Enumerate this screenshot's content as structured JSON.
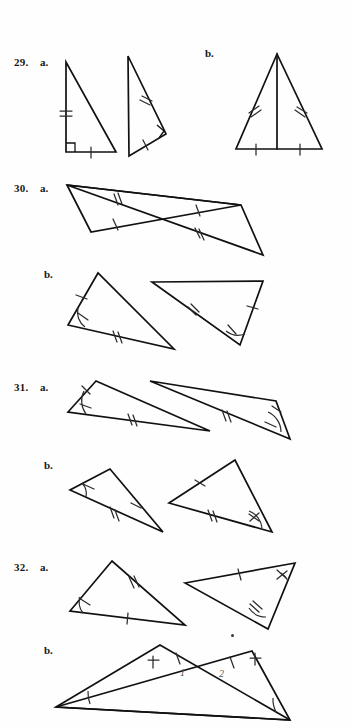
{
  "page": {
    "width": 351,
    "height": 727,
    "background": "#fefefe",
    "ink_color": "#111111",
    "mark_color": "#2b2b2b",
    "kind": "textbook-exercise-page"
  },
  "problems": [
    {
      "number": "29.",
      "parts": [
        {
          "label": "a.",
          "description": "two right triangles, one leg double-tick and one leg single-tick each, right-angle squares marked"
        },
        {
          "label": "b.",
          "description": "isosceles triangle with altitude drawn to base; legs double-tick, base halves single-tick"
        }
      ]
    },
    {
      "number": "30.",
      "parts": [
        {
          "label": "a.",
          "description": "bowtie of two triangles meeting at a common vertex; upper sides double-tick, lower sides single-tick"
        },
        {
          "label": "b.",
          "description": "two separate triangles; one side single-tick, one side double-tick, included angle arced"
        }
      ]
    },
    {
      "number": "31.",
      "parts": [
        {
          "label": "a.",
          "description": "two thin triangles; one side double-tick, adjacent angles arced with single tick"
        },
        {
          "label": "b.",
          "description": "two triangles; one side single-tick, one side double-tick, one angle arced"
        }
      ]
    },
    {
      "number": "32.",
      "parts": [
        {
          "label": "a.",
          "description": "two triangles; sides single-tick and double-tick, angles arced"
        },
        {
          "label": "b.",
          "description": "two overlapping triangles sharing a crossing region; angles labeled 1 and 2"
        }
      ]
    }
  ],
  "labels": {
    "p29_num": "29.",
    "p29_a": "a.",
    "p29_b": "b.",
    "p30_num": "30.",
    "p30_a": "a.",
    "p30_b": "b.",
    "p31_num": "31.",
    "p31_a": "a.",
    "p31_b": "b.",
    "p32_num": "32.",
    "p32_a": "a.",
    "p32_b": "b.",
    "angle_1": "1",
    "angle_2": "2"
  }
}
